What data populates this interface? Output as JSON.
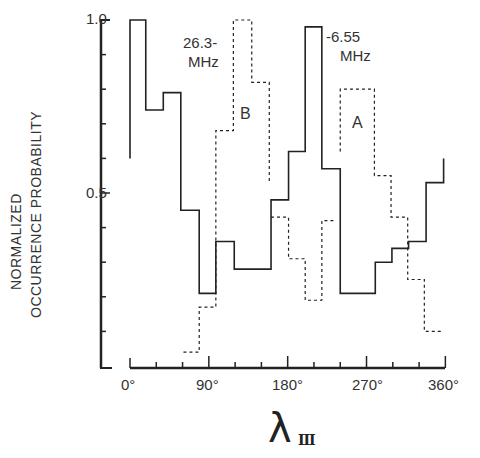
{
  "chart_data": {
    "type": "line",
    "style": "step-histogram",
    "title": "",
    "xlabel": "λ_III",
    "xlabel_main": "λ",
    "xlabel_sub": "III",
    "ylabel_line1": "NORMALIZED",
    "ylabel_line2": "OCCURRENCE  PROBABILITY",
    "ylabel": "NORMALIZED OCCURRENCE PROBABILITY",
    "xlim": [
      0,
      360
    ],
    "ylim": [
      0,
      1.0
    ],
    "x_ticks": [
      "0°",
      "90°",
      "180°",
      "270°",
      "360°"
    ],
    "y_ticks": [
      "0.5",
      "1.0"
    ],
    "grid": false,
    "annotations": [
      {
        "text_line1": "26.3-",
        "text_line2": "MHz"
      },
      {
        "text_line1": "-6.55",
        "text_line2": "MHz"
      },
      {
        "text": "B"
      },
      {
        "text": "A"
      }
    ],
    "series": [
      {
        "name": "6.55 MHz (solid)",
        "line": "solid",
        "bin_edges_deg": [
          0,
          18,
          38,
          58,
          79,
          98,
          119,
          139,
          161,
          181,
          200,
          219,
          240,
          260,
          280,
          299,
          318,
          338,
          358
        ],
        "values": [
          1.0,
          0.74,
          0.79,
          0.45,
          0.21,
          0.36,
          0.28,
          0.28,
          0.48,
          0.62,
          0.98,
          0.57,
          0.21,
          0.21,
          0.3,
          0.34,
          0.36,
          0.53
        ],
        "start_value": 0.6,
        "end_value": 0.6
      },
      {
        "name": "26.3 MHz source B (dashed)",
        "line": "dashed",
        "bin_edges_deg": [
          61,
          79,
          98,
          118,
          139,
          159
        ],
        "values": [
          0.04,
          0.17,
          0.68,
          1.0,
          0.82
        ],
        "end_value": 0.53
      },
      {
        "name": "26.3 MHz (dashed, middle)",
        "line": "dashed",
        "bin_edges_deg": [
          161,
          181,
          200,
          219,
          234
        ],
        "values": [
          0.43,
          0.31,
          0.19,
          0.42
        ]
      },
      {
        "name": "26.3 MHz source A (dashed)",
        "line": "dashed",
        "bin_edges_deg": [
          240,
          279,
          298,
          317,
          336,
          356
        ],
        "values": [
          0.8,
          0.55,
          0.43,
          0.25,
          0.1
        ],
        "start_value": 0.62
      }
    ]
  },
  "labels": {
    "y_top": "1.0",
    "y_mid": "0.5",
    "x0": "0°",
    "x90": "90°",
    "x180": "180°",
    "x270": "270°",
    "x360": "360°",
    "ann_b_freq_1": "26.3-",
    "ann_b_freq_2": "MHz",
    "ann_a_freq_1": "-6.55",
    "ann_a_freq_2": "MHz",
    "ann_b": "B",
    "ann_a": "A",
    "ylabel_1": "NORMALIZED",
    "ylabel_2": "OCCURRENCE  PROBABILITY",
    "xlabel_main": "λ",
    "xlabel_sub": "III"
  },
  "colors": {
    "ink": "#222222",
    "background": "#ffffff"
  }
}
